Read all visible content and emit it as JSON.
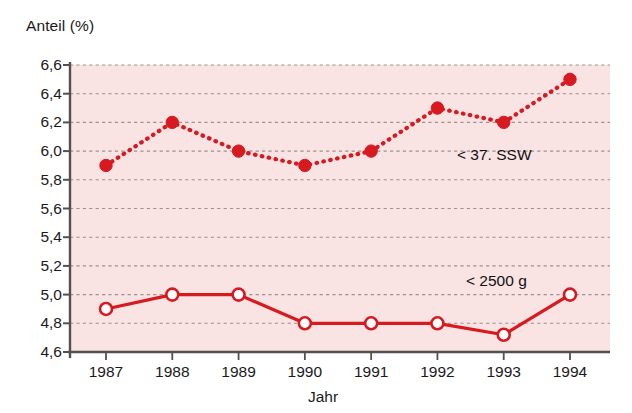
{
  "chart_data": {
    "type": "line",
    "title": "",
    "subtitle": "",
    "xlabel": "Jahr",
    "ylabel": "Anteil (%)",
    "categories": [
      "1987",
      "1988",
      "1989",
      "1990",
      "1991",
      "1992",
      "1993",
      "1994"
    ],
    "x": [
      1987,
      1988,
      1989,
      1990,
      1991,
      1992,
      1993,
      1994
    ],
    "ylim": [
      4.6,
      6.6
    ],
    "ytick_labels": [
      "6,6",
      "6,4",
      "6,2",
      "6,0",
      "5,8",
      "5,6",
      "5,4",
      "5,2",
      "5,0",
      "4,8",
      "4,6"
    ],
    "ytick_values": [
      6.6,
      6.4,
      6.2,
      6.0,
      5.8,
      5.6,
      5.4,
      5.2,
      5.0,
      4.8,
      4.6
    ],
    "grid": true,
    "grid_style": "dotted",
    "legend_position": "inline-annotation",
    "plot_background": "#f9e3e3",
    "series": [
      {
        "name": "< 37. SSW",
        "values": [
          5.9,
          6.2,
          6.0,
          5.9,
          6.0,
          6.3,
          6.2,
          6.5
        ],
        "color": "#d71920",
        "line_style": "dotted",
        "marker": "filled-circle",
        "annotation": "< 37. SSW"
      },
      {
        "name": "< 2500 g",
        "values": [
          4.9,
          5.0,
          5.0,
          4.8,
          4.8,
          4.8,
          4.72,
          5.0
        ],
        "color": "#d71920",
        "line_style": "solid",
        "marker": "open-circle",
        "annotation": "< 2500 g"
      }
    ],
    "annotations": [
      {
        "text": "< 37. SSW",
        "series": "< 37. SSW",
        "x": 457,
        "y": 146
      },
      {
        "text": "< 2500 g",
        "series": "< 2500 g",
        "x": 466,
        "y": 272
      }
    ],
    "colors": {
      "accent": "#d71920",
      "plot_bg": "#f9e3e3",
      "axis": "#55504f",
      "grid": "#8d8484",
      "text": "#1a1a1a"
    }
  }
}
